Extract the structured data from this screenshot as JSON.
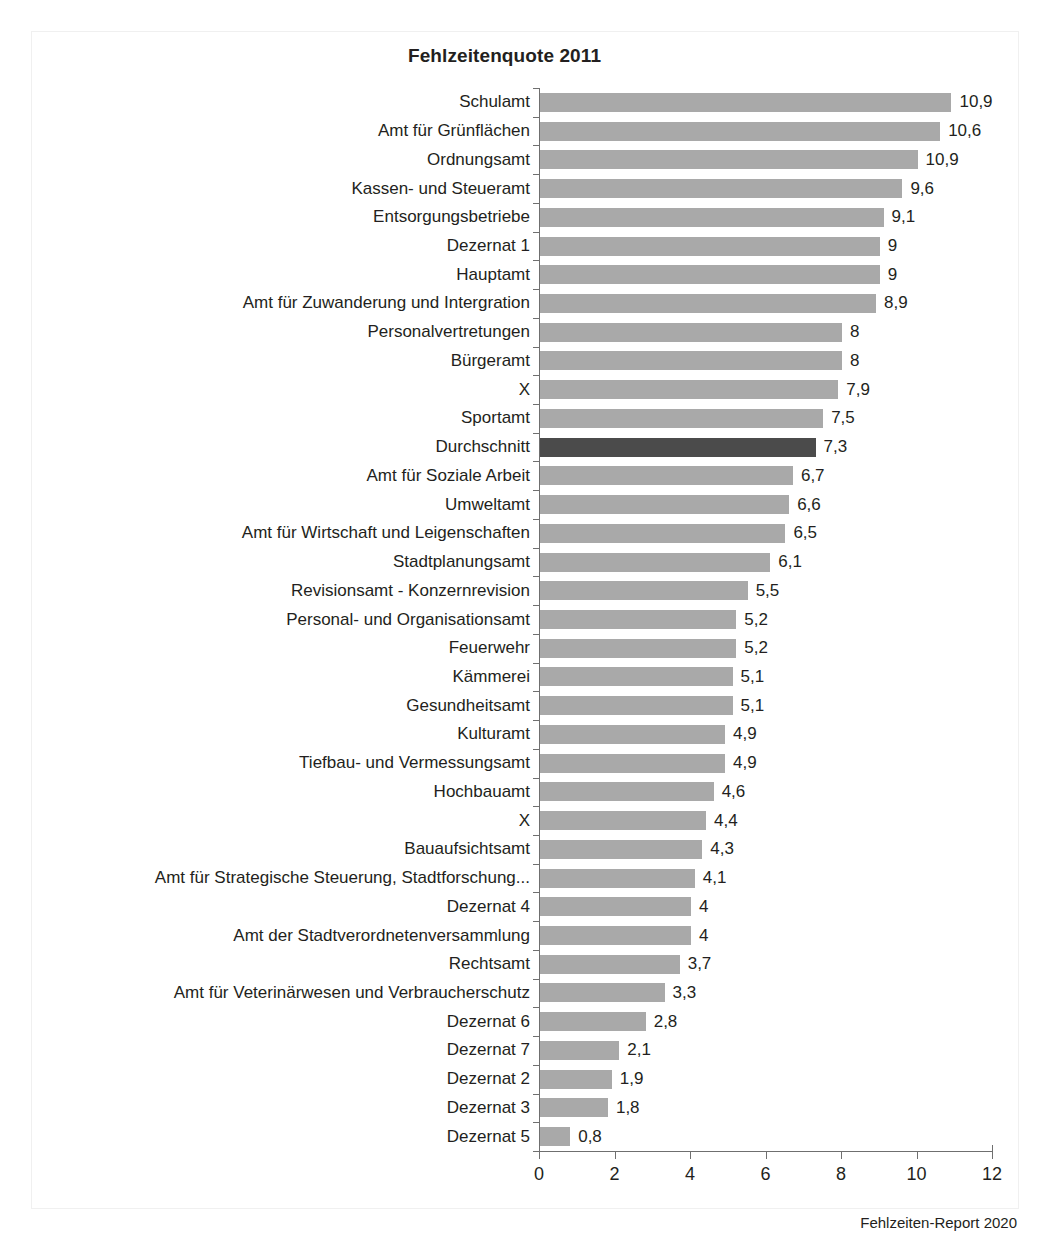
{
  "chart_data": {
    "type": "bar",
    "orientation": "horizontal",
    "title": "Fehlzeitenquote 2011",
    "xlabel": "",
    "ylabel": "Organisationseinhet",
    "xlim": [
      0,
      12
    ],
    "xticks": [
      "0",
      "2",
      "4",
      "6",
      "8",
      "10",
      "12"
    ],
    "grid": false,
    "legend": null,
    "source_note": "Fehlzeiten-Report 2020",
    "highlight_category": "Durchschnitt",
    "colors": {
      "bar": "#a9a9a9",
      "bar_highlight": "#4b4b4b",
      "axis": "#6f6f6f",
      "text": "#231f20",
      "background": "#ffffff"
    },
    "categories": [
      "Schulamt",
      "Amt für Grünflächen",
      "Ordnungsamt",
      "Kassen- und Steueramt",
      "Entsorgungsbetriebe",
      "Dezernat 1",
      "Hauptamt",
      "Amt für Zuwanderung und Intergration",
      "Personalvertretungen",
      "Bürgeramt",
      "X",
      "Sportamt",
      "Durchschnitt",
      "Amt für Soziale Arbeit",
      "Umweltamt",
      "Amt für Wirtschaft und Leigenschaften",
      "Stadtplanungsamt",
      "Revisionsamt - Konzernrevision",
      "Personal- und Organisationsamt",
      "Feuerwehr",
      "Kämmerei",
      "Gesundheitsamt",
      "Kulturamt",
      "Tiefbau- und Vermessungsamt",
      "Hochbauamt",
      "X",
      "Bauaufsichtsamt",
      "Amt für Strategische Steuerung, Stadtforschung...",
      "Dezernat 4",
      "Amt der Stadtverordnetenversammlung",
      "Rechtsamt",
      "Amt für Veterinärwesen und Verbraucherschutz",
      "Dezernat 6",
      "Dezernat 7",
      "Dezernat 2",
      "Dezernat 3",
      "Dezernat 5"
    ],
    "values": [
      10.9,
      10.6,
      10.0,
      9.6,
      9.1,
      9.0,
      9.0,
      8.9,
      8.0,
      8.0,
      7.9,
      7.5,
      7.3,
      6.7,
      6.6,
      6.5,
      6.1,
      5.5,
      5.2,
      5.2,
      5.1,
      5.1,
      4.9,
      4.9,
      4.6,
      4.4,
      4.3,
      4.1,
      4.0,
      4.0,
      3.7,
      3.3,
      2.8,
      2.1,
      1.9,
      1.8,
      0.8
    ],
    "value_labels": [
      "10,9",
      "10,6",
      "10,9",
      "9,6",
      "9,1",
      "9",
      "9",
      "8,9",
      "8",
      "8",
      "7,9",
      "7,5",
      "7,3",
      "6,7",
      "6,6",
      "6,5",
      "6,1",
      "5,5",
      "5,2",
      "5,2",
      "5,1",
      "5,1",
      "4,9",
      "4,9",
      "4,6",
      "4,4",
      "4,3",
      "4,1",
      "4",
      "4",
      "3,7",
      "3,3",
      "2,8",
      "2,1",
      "1,9",
      "1,8",
      "0,8"
    ]
  }
}
